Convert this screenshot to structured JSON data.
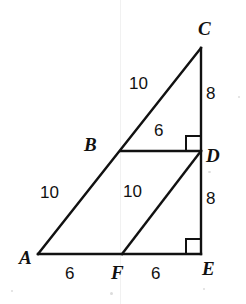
{
  "figure": {
    "kind": "geometry-diagram",
    "stroke_color": "#111111",
    "background_color": "#ffffff",
    "vertices": [
      {
        "name": "C",
        "label": "C",
        "x": 201,
        "y": 48
      },
      {
        "name": "B",
        "label": "B",
        "x": 122,
        "y": 151
      },
      {
        "name": "D",
        "label": "D",
        "x": 201,
        "y": 151
      },
      {
        "name": "A",
        "label": "A",
        "x": 38,
        "y": 254
      },
      {
        "name": "F",
        "label": "F",
        "x": 122,
        "y": 254
      },
      {
        "name": "E",
        "label": "E",
        "x": 201,
        "y": 254
      }
    ],
    "segments": [
      {
        "name": "hypotenuse-AC",
        "from": "A",
        "to": "C"
      },
      {
        "name": "base-AE",
        "from": "A",
        "to": "E"
      },
      {
        "name": "vertical-CE",
        "from": "C",
        "to": "E"
      },
      {
        "name": "midsegment-BD",
        "from": "B",
        "to": "D"
      },
      {
        "name": "hypotenuse-FD",
        "from": "F",
        "to": "D"
      }
    ],
    "right_angles": [
      {
        "name": "right-angle-at-D",
        "vertex": "D"
      },
      {
        "name": "right-angle-at-E",
        "vertex": "E"
      }
    ],
    "measurements": {
      "BC": "10",
      "CD": "8",
      "BD": "6",
      "AB": "10",
      "FD": "10",
      "DE": "8",
      "AF": "6",
      "FE": "6"
    }
  }
}
